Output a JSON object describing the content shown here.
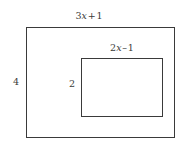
{
  "figure": {
    "type": "nested-rectangles-area-diagram",
    "background_color": "#ffffff",
    "stroke_color": "#3a3a3a",
    "labels": {
      "outer_width": {
        "text": "3x + 1",
        "coefficient": "3",
        "variable": "x",
        "operator": "+",
        "constant": "1",
        "position": "top-outside-center"
      },
      "outer_height": {
        "text": "4",
        "position": "left-outside-middle"
      },
      "inner_width": {
        "text": "2x – 1",
        "coefficient": "2",
        "variable": "x",
        "operator": "–",
        "constant": "1",
        "position": "top-inside-center"
      },
      "inner_height": {
        "text": "2",
        "position": "left-of-inner-rectangle"
      }
    },
    "shapes": {
      "outer_rectangle": {
        "name": "outer rectangle",
        "width_expression": "3x + 1",
        "height_expression": "4"
      },
      "inner_rectangle": {
        "name": "inner rectangle",
        "width_expression": "2x – 1",
        "height_expression": "2"
      }
    }
  },
  "chart_data": {
    "type": "table",
    "title": "",
    "categories": [
      "outer rectangle",
      "inner rectangle"
    ],
    "series": [
      {
        "name": "width",
        "values": [
          "3x + 1",
          "2x – 1"
        ]
      },
      {
        "name": "height",
        "values": [
          "4",
          "2"
        ]
      }
    ]
  }
}
